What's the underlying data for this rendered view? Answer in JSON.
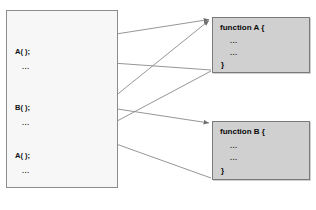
{
  "top_strip_text": "",
  "caller_panel": {
    "name": "caller-code-panel",
    "lines": [
      {
        "text": "A( );",
        "kind": "call",
        "x": 8,
        "y": 40
      },
      {
        "text": "...",
        "kind": "dots",
        "x": 15,
        "y": 55
      },
      {
        "text": "B( );",
        "kind": "call",
        "x": 8,
        "y": 95
      },
      {
        "text": "...",
        "kind": "dots",
        "x": 15,
        "y": 110
      },
      {
        "text": "A( );",
        "kind": "call",
        "x": 8,
        "y": 143
      },
      {
        "text": "...",
        "kind": "dots",
        "x": 15,
        "y": 158
      }
    ]
  },
  "functions": [
    {
      "id": "func-a",
      "title": "function A {",
      "body": [
        "...",
        "..."
      ],
      "close": "}"
    },
    {
      "id": "func-b",
      "title": "function B {",
      "body": [
        "...",
        "..."
      ],
      "close": "}"
    }
  ],
  "colors": {
    "panel_fill": "#f7f7f7",
    "panel_border": "#8c8c8c",
    "function_fill": "#d0d0d0",
    "function_border": "#7a7a7a",
    "arrow": "#8a8a8a",
    "text": "#111111"
  },
  "arrows": [
    {
      "name": "call-a-first",
      "from": [
        52,
        44
      ],
      "to": [
        212,
        19
      ],
      "label": "first call to A"
    },
    {
      "name": "return-a-first",
      "from": [
        212,
        70
      ],
      "to": [
        40,
        58
      ],
      "label": "return from A to caller"
    },
    {
      "name": "call-b",
      "from": [
        52,
        99
      ],
      "to": [
        212,
        123
      ],
      "label": "call to B"
    },
    {
      "name": "return-b",
      "from": [
        212,
        178
      ],
      "to": [
        36,
        115
      ],
      "label": "return from B to caller"
    },
    {
      "name": "call-a-second",
      "from": [
        52,
        147
      ],
      "to": [
        212,
        19
      ],
      "label": "second call to A"
    },
    {
      "name": "return-a-second",
      "from": [
        212,
        70
      ],
      "to": [
        40,
        160
      ],
      "label": "return from A after second call"
    }
  ]
}
